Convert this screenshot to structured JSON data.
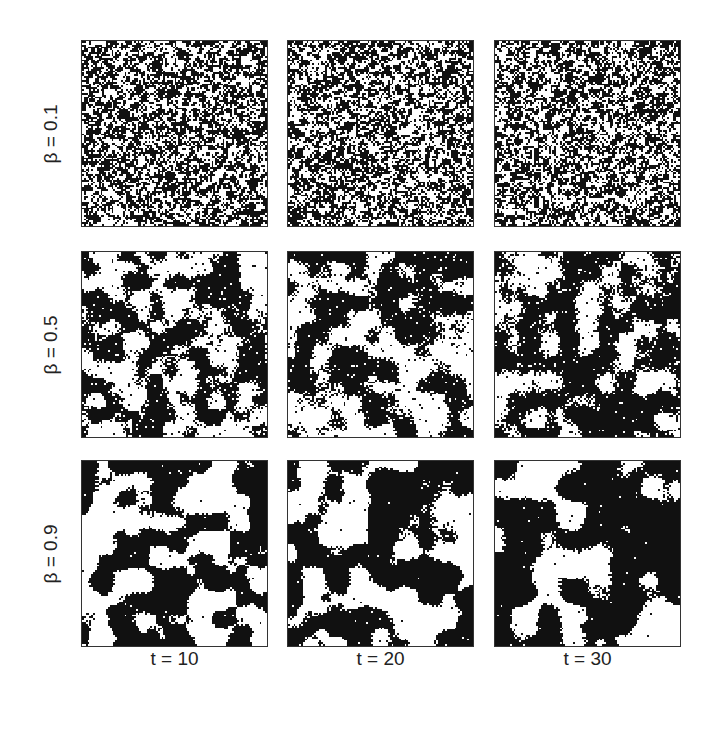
{
  "figure": {
    "rows": [
      {
        "label": "β = 0.1",
        "beta": 0.1
      },
      {
        "label": "β = 0.5",
        "beta": 0.5
      },
      {
        "label": "β = 0.9",
        "beta": 0.9
      }
    ],
    "columns": [
      {
        "label": "t = 10",
        "t": 10
      },
      {
        "label": "t = 20",
        "t": 20
      },
      {
        "label": "t = 30",
        "t": 30
      }
    ],
    "lattice_size": 100,
    "colors": {
      "spin_up": "#ffffff",
      "spin_down": "#111111",
      "border": "#333333"
    }
  }
}
